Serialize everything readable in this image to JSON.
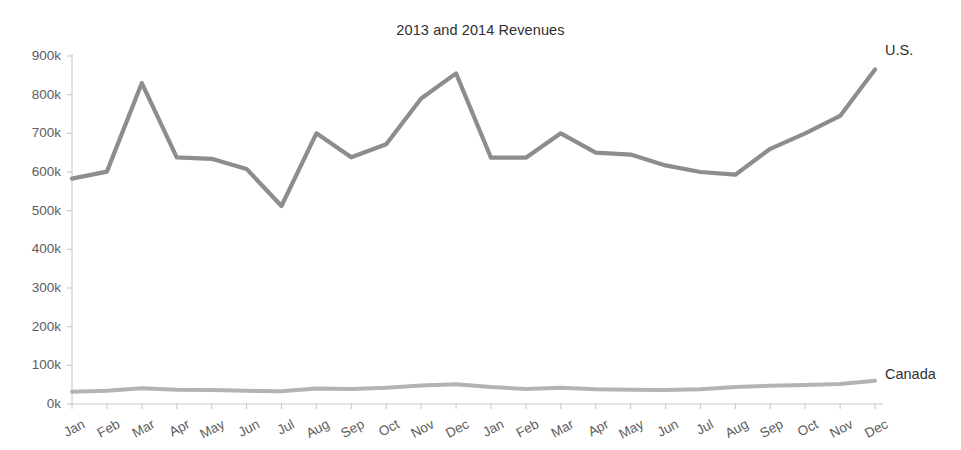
{
  "chart_data": {
    "type": "line",
    "title": "2013 and 2014 Revenues",
    "xlabel": "",
    "ylabel": "",
    "ylim": [
      0,
      900000
    ],
    "grid": false,
    "legend_position": "end-of-line-labels",
    "y_ticks": [
      0,
      100000,
      200000,
      300000,
      400000,
      500000,
      600000,
      700000,
      800000,
      900000
    ],
    "y_tick_labels": [
      "0k",
      "100k",
      "200k",
      "300k",
      "400k",
      "500k",
      "600k",
      "700k",
      "800k",
      "900k"
    ],
    "categories": [
      "Jan",
      "Feb",
      "Mar",
      "Apr",
      "May",
      "Jun",
      "Jul",
      "Aug",
      "Sep",
      "Oct",
      "Nov",
      "Dec",
      "Jan",
      "Feb",
      "Mar",
      "Apr",
      "May",
      "Jun",
      "Jul",
      "Aug",
      "Sep",
      "Oct",
      "Nov",
      "Dec"
    ],
    "series": [
      {
        "name": "U.S.",
        "color": "#8d8d8d",
        "values": [
          583000,
          601000,
          830000,
          638000,
          634000,
          608000,
          512000,
          700000,
          638000,
          672000,
          790000,
          855000,
          637000,
          637000,
          700000,
          650000,
          645000,
          617000,
          600000,
          593000,
          660000,
          700000,
          745000,
          865000
        ]
      },
      {
        "name": "Canada",
        "color": "#b3b3b3",
        "values": [
          32000,
          34000,
          41000,
          37000,
          36000,
          34000,
          33000,
          40000,
          39000,
          42000,
          48000,
          51000,
          44000,
          39000,
          42000,
          38000,
          37000,
          36000,
          38000,
          44000,
          47000,
          49000,
          52000,
          60000
        ]
      }
    ]
  },
  "axes": {
    "y_axis_name": "revenue-axis",
    "x_axis_name": "month-axis"
  }
}
